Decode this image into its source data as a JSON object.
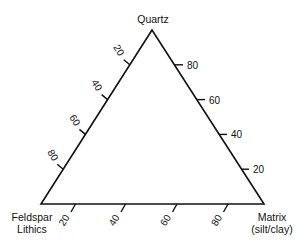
{
  "diagram": {
    "type": "ternary",
    "vertices": {
      "top": "Quartz",
      "bottom_left_line1": "Feldspar",
      "bottom_left_line2": "Lithics",
      "bottom_right_line1": "Matrix",
      "bottom_right_line2": "(silt/clay)"
    },
    "left_axis_ticks": [
      "20",
      "40",
      "60",
      "80"
    ],
    "right_axis_ticks": [
      "80",
      "60",
      "40",
      "20"
    ],
    "bottom_axis_ticks": [
      "20",
      "40",
      "60",
      "80"
    ]
  }
}
